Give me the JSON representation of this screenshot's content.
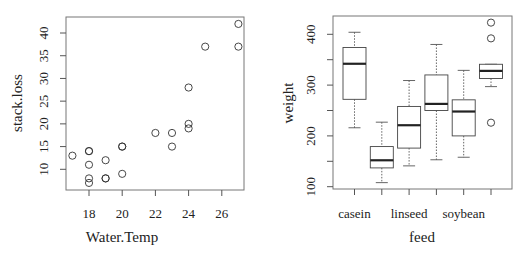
{
  "chart_data": [
    {
      "type": "scatter",
      "title": "",
      "xlabel": "Water.Temp",
      "ylabel": "stack.loss",
      "xlim": [
        16.7,
        27.3
      ],
      "ylim": [
        5.6,
        43.4
      ],
      "xticks": [
        18,
        20,
        22,
        24,
        26
      ],
      "yticks": [
        10,
        15,
        20,
        25,
        30,
        35,
        40
      ],
      "grid": false,
      "legend": null,
      "x": [
        27,
        27,
        25,
        24,
        22,
        23,
        24,
        24,
        23,
        18,
        18,
        17,
        18,
        19,
        18,
        18,
        19,
        19,
        20,
        20,
        20
      ],
      "y": [
        42,
        37,
        37,
        28,
        18,
        18,
        19,
        20,
        15,
        14,
        14,
        13,
        11,
        12,
        8,
        7,
        8,
        8,
        9,
        15,
        15
      ]
    },
    {
      "type": "boxplot",
      "title": "",
      "xlabel": "feed",
      "ylabel": "weight",
      "ylim": [
        100,
        430
      ],
      "yticks": [
        100,
        150,
        200,
        250,
        300,
        350,
        400
      ],
      "ytick_labels": [
        "100",
        "",
        "200",
        "",
        "300",
        "",
        "400"
      ],
      "categories": [
        "casein",
        "horsebean",
        "linseed",
        "meatmeal",
        "soybean",
        "sunflower"
      ],
      "visible_category_labels": [
        "casein",
        "",
        "linseed",
        "",
        "soybean",
        ""
      ],
      "grid": false,
      "legend": null,
      "series": [
        {
          "name": "casein",
          "whisker_low": 216,
          "q1": 272,
          "median": 342,
          "q3": 374,
          "whisker_high": 404,
          "outliers": []
        },
        {
          "name": "horsebean",
          "whisker_low": 108,
          "q1": 137,
          "median": 152,
          "q3": 179,
          "whisker_high": 227,
          "outliers": []
        },
        {
          "name": "linseed",
          "whisker_low": 141,
          "q1": 176,
          "median": 221,
          "q3": 258,
          "whisker_high": 309,
          "outliers": []
        },
        {
          "name": "meatmeal",
          "whisker_low": 153,
          "q1": 250,
          "median": 263,
          "q3": 320,
          "whisker_high": 380,
          "outliers": []
        },
        {
          "name": "soybean",
          "whisker_low": 158,
          "q1": 200,
          "median": 248,
          "q3": 271,
          "whisker_high": 329,
          "outliers": []
        },
        {
          "name": "sunflower",
          "whisker_low": 297,
          "q1": 313,
          "median": 328,
          "q3": 341,
          "whisker_high": 341,
          "outliers": [
            226,
            392,
            423
          ]
        }
      ]
    }
  ],
  "left_plot": {
    "xlabel": "Water.Temp",
    "ylabel": "stack.loss",
    "xtick_labels": [
      "18",
      "20",
      "22",
      "24",
      "26"
    ],
    "ytick_labels": [
      "10",
      "15",
      "20",
      "25",
      "30",
      "35",
      "40"
    ]
  },
  "right_plot": {
    "xlabel": "feed",
    "ylabel": "weight",
    "xtick_labels": [
      "casein",
      "linseed",
      "soybean"
    ],
    "ytick_labels": [
      "100",
      "200",
      "300",
      "400"
    ]
  }
}
